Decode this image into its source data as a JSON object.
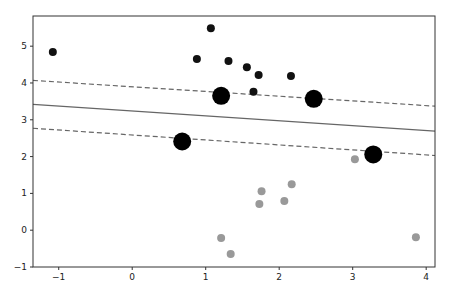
{
  "chart_data": {
    "type": "scatter",
    "title": "",
    "xlabel": "",
    "ylabel": "",
    "xlim": [
      -1.35,
      4.12
    ],
    "ylim": [
      -1.0,
      5.82
    ],
    "x_ticks": [
      -1,
      0,
      1,
      2,
      3,
      4
    ],
    "y_ticks": [
      -1,
      0,
      1,
      2,
      3,
      4,
      5
    ],
    "grid": false,
    "legend": null,
    "series": [
      {
        "name": "class-black",
        "color": "#111111",
        "marker_size": 4,
        "points": [
          [
            -1.08,
            4.84
          ],
          [
            1.07,
            5.49
          ],
          [
            0.88,
            4.65
          ],
          [
            1.31,
            4.6
          ],
          [
            1.56,
            4.43
          ],
          [
            1.72,
            4.22
          ],
          [
            2.16,
            4.19
          ],
          [
            1.65,
            3.76
          ]
        ]
      },
      {
        "name": "class-gray",
        "color": "#999999",
        "marker_size": 4,
        "points": [
          [
            3.03,
            1.93
          ],
          [
            1.76,
            1.06
          ],
          [
            1.73,
            0.71
          ],
          [
            2.17,
            1.25
          ],
          [
            2.07,
            0.79
          ],
          [
            1.21,
            -0.21
          ],
          [
            1.34,
            -0.65
          ],
          [
            3.86,
            -0.19
          ]
        ]
      },
      {
        "name": "support-vectors",
        "color": "#000000",
        "marker_size": 9,
        "points": [
          [
            1.21,
            3.65
          ],
          [
            2.47,
            3.57
          ],
          [
            0.68,
            2.41
          ],
          [
            3.28,
            2.06
          ]
        ]
      }
    ],
    "lines": [
      {
        "name": "decision-boundary",
        "style": "solid",
        "color": "#666666",
        "x": [
          -1.35,
          4.12
        ],
        "y": [
          3.42,
          2.69
        ]
      },
      {
        "name": "margin-upper",
        "style": "dashed",
        "color": "#666666",
        "x": [
          -1.35,
          4.12
        ],
        "y": [
          4.07,
          3.37
        ]
      },
      {
        "name": "margin-lower",
        "style": "dashed",
        "color": "#666666",
        "x": [
          -1.35,
          4.12
        ],
        "y": [
          2.77,
          2.03
        ]
      }
    ]
  },
  "layout": {
    "plot_left": 33,
    "plot_right": 435,
    "plot_top": 16,
    "plot_bottom": 267
  }
}
